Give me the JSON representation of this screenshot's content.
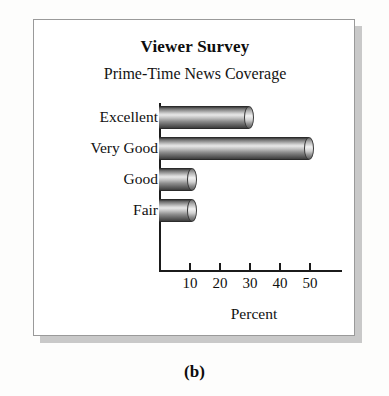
{
  "figure": {
    "caption": "(b)"
  },
  "chart_data": {
    "type": "bar",
    "orientation": "horizontal",
    "title": "Viewer Survey",
    "subtitle": "Prime-Time News Coverage",
    "categories": [
      "Excellent",
      "Very Good",
      "Good",
      "Fair"
    ],
    "values": [
      30,
      50,
      11,
      11
    ],
    "xlabel": "Percent",
    "ylabel": "",
    "xlim": [
      0,
      53
    ],
    "xticks": [
      10,
      20,
      30,
      40,
      50
    ],
    "xtick_labels": [
      "10",
      "20",
      "30",
      "40",
      "50"
    ],
    "grid": false,
    "legend": null,
    "bar_style": "3d-cylinder-grayscale",
    "colors": {
      "bar_dark": "#3a3a3a",
      "bar_highlight": "#e8e8e8",
      "axis": "#1b1b1b",
      "text": "#101010",
      "frame_border": "#9a9a9a",
      "frame_shadow": "#c9c9c9",
      "panel_background": "#ffffff",
      "page_background": "#fdfdfc"
    }
  }
}
